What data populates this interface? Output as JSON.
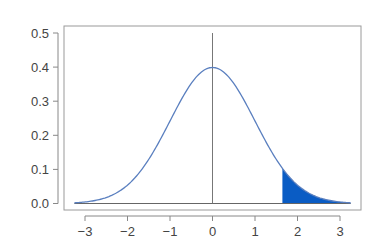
{
  "chart_data": {
    "type": "area",
    "title": "",
    "xlabel": "",
    "ylabel": "",
    "xlim": [
      -3.3,
      3.3
    ],
    "ylim": [
      0.0,
      0.5
    ],
    "grid": false,
    "legend": null,
    "x_ticks": [
      -3,
      -2,
      -1,
      0,
      1,
      2,
      3
    ],
    "x_tick_labels": [
      "−3",
      "−2",
      "−1",
      "0",
      "1",
      "2",
      "3"
    ],
    "y_ticks": [
      0.0,
      0.1,
      0.2,
      0.3,
      0.4,
      0.5
    ],
    "y_tick_labels": [
      "0.0",
      "0.1",
      "0.2",
      "0.3",
      "0.4",
      "0.5"
    ],
    "series": [
      {
        "name": "standard normal density",
        "function": "dnorm(x, 0, 1)",
        "x_range": [
          -3.25,
          3.25
        ],
        "color": "#5a7fbf",
        "x": [
          -3.0,
          -2.5,
          -2.0,
          -1.5,
          -1.0,
          -0.5,
          0.0,
          0.5,
          1.0,
          1.5,
          2.0,
          2.5,
          3.0
        ],
        "values": [
          0.004,
          0.018,
          0.054,
          0.13,
          0.242,
          0.352,
          0.399,
          0.352,
          0.242,
          0.13,
          0.054,
          0.018,
          0.004
        ]
      }
    ],
    "shaded_region": {
      "from": 1.645,
      "to": 3.25,
      "color": "#0a5cc4",
      "label": "upper tail area"
    },
    "reference_line": {
      "x": 0,
      "y_from": 0.0,
      "y_to": 0.5,
      "color": "#777777"
    }
  }
}
